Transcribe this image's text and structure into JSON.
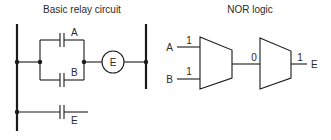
{
  "relay_circuit": {
    "title": "Basic relay circuit",
    "contacts": [
      {
        "label": "A",
        "type": "normally-open"
      },
      {
        "label": "B",
        "type": "normally-open"
      },
      {
        "label": "E",
        "type": "normally-open"
      }
    ],
    "coil": {
      "label": "E"
    }
  },
  "nor_logic": {
    "title": "NOR logic",
    "inputs": [
      {
        "name": "A",
        "value": "1"
      },
      {
        "name": "B",
        "value": "1"
      }
    ],
    "intermediate_value": "0",
    "output": {
      "name": "E",
      "value": "1"
    }
  },
  "colors": {
    "line": "#1a1a1a",
    "text": "#2a2a2a",
    "background": "#ffffff"
  }
}
